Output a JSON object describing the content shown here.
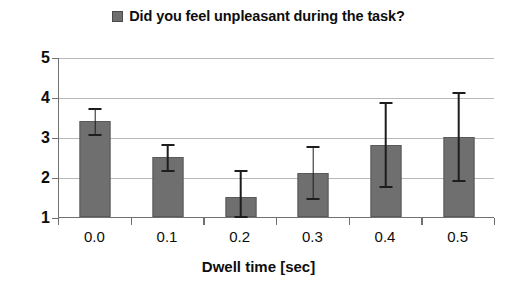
{
  "chart_data": {
    "type": "bar",
    "title": "",
    "legend": [
      {
        "label": "Did you feel unpleasant during the task?",
        "color": "#6f6f6f",
        "marker": "square"
      }
    ],
    "legend_position": "top-center",
    "xlabel": "Dwell time [sec]",
    "ylabel": "",
    "categories": [
      "0.0",
      "0.1",
      "0.2",
      "0.3",
      "0.4",
      "0.5"
    ],
    "values": [
      3.4,
      2.5,
      1.5,
      2.1,
      2.8,
      3.0
    ],
    "errors_upper": [
      3.75,
      2.85,
      2.2,
      2.8,
      3.9,
      4.15
    ],
    "errors_lower": [
      3.05,
      2.15,
      1.0,
      1.45,
      1.75,
      1.9
    ],
    "error_bars": [
      0.35,
      0.35,
      0.6,
      0.68,
      1.05,
      1.1
    ],
    "ylim": [
      1,
      5
    ],
    "yticks": [
      1,
      2,
      3,
      4,
      5
    ],
    "ytick_labels": [
      "1",
      "2",
      "3",
      "4",
      "5"
    ],
    "grid": true,
    "grid_axis": "y",
    "bar_color": "#6f6f6f",
    "bar_edge_color": "#5a5a5a",
    "error_color": "#1d1d1d",
    "grid_color": "#b9b9b9",
    "axis_color": "#707070",
    "background": "#ffffff"
  }
}
